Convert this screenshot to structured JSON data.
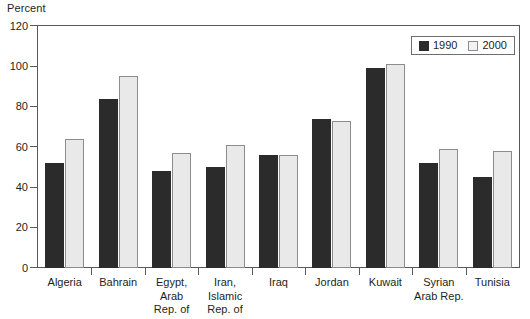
{
  "chart_data": {
    "type": "bar",
    "title": "",
    "subtitle": "",
    "xlabel": "",
    "ylabel": "Percent",
    "ylim": [
      0,
      120
    ],
    "yticks": [
      0,
      20,
      40,
      60,
      80,
      100,
      120
    ],
    "grid": false,
    "legend_position": "top-right",
    "categories": [
      "Algeria",
      "Bahrain",
      "Egypt,\nArab\nRep. of",
      "Iran,\nIslamic\nRep. of",
      "Iraq",
      "Jordan",
      "Kuwait",
      "Syrian\nArab Rep.",
      "Tunisia"
    ],
    "series": [
      {
        "name": "1990",
        "color": "#2b2b2b",
        "values": [
          52,
          84,
          48,
          50,
          56,
          74,
          99,
          52,
          45
        ]
      },
      {
        "name": "2000",
        "color": "#e9e9e9",
        "values": [
          64,
          95,
          57,
          61,
          56,
          73,
          101,
          59,
          58
        ]
      }
    ]
  },
  "legend": {
    "entries": [
      {
        "label": "1990"
      },
      {
        "label": "2000"
      }
    ]
  },
  "colors": {
    "series_1990": "#2b2b2b",
    "series_2000": "#e9e9e9",
    "axis": "#58595b",
    "text": "#231f20",
    "background": "#ffffff"
  }
}
